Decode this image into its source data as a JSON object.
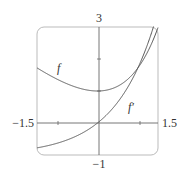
{
  "chart_data": {
    "type": "line",
    "title": "",
    "xlabel": "",
    "ylabel": "",
    "xlim": [
      -1.5,
      1.5
    ],
    "ylim": [
      -1,
      3
    ],
    "tick_labels": {
      "x_min": "−1.5",
      "x_max": "1.5",
      "y_min": "−1",
      "y_max": "3"
    },
    "grid": false,
    "legend": "inline labels",
    "series": [
      {
        "name": "f",
        "label": "f",
        "x": [
          -1.5,
          -1.0,
          -0.5,
          0.0,
          0.5,
          1.0,
          1.25,
          1.5
        ],
        "values": [
          1.72,
          1.37,
          1.11,
          1.0,
          1.15,
          1.72,
          2.24,
          2.98
        ]
      },
      {
        "name": "f'",
        "label": "f′",
        "x": [
          -1.5,
          -1.0,
          -0.5,
          0.0,
          0.5,
          1.0,
          1.25,
          1.4
        ],
        "values": [
          -0.78,
          -0.63,
          -0.39,
          0.0,
          0.65,
          1.72,
          2.49,
          3.0
        ]
      }
    ],
    "annotations": [
      "f",
      "f′"
    ]
  },
  "colors": {
    "curve": "#555555",
    "axis": "#666666",
    "frame": "#bbbbbb"
  }
}
